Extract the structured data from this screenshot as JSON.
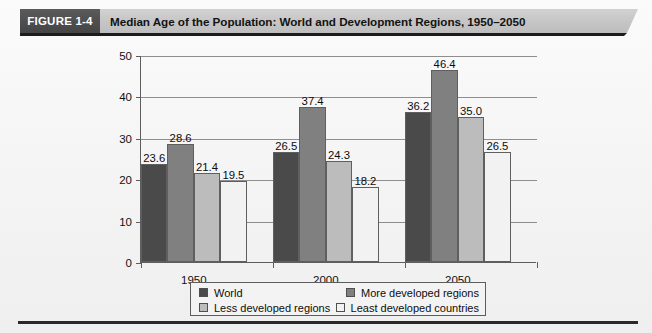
{
  "figure": {
    "badge": "FIGURE 1-4",
    "title": "Median Age of the Population: World and Development Regions, 1950–2050"
  },
  "colors": {
    "world": "#4a4a4a",
    "more_developed": "#808080",
    "less_developed": "#bcbcbc",
    "least_developed": "#f2f2f2",
    "axis": "#5d5d5d",
    "grid": "#8e8e8e",
    "badge_bg": "#4f4f4f",
    "band_bg": "#c6c6c6"
  },
  "legend": {
    "items": [
      {
        "label": "World",
        "color": "#4a4a4a"
      },
      {
        "label": "More developed regions",
        "color": "#808080"
      },
      {
        "label": "Less developed regions",
        "color": "#bcbcbc"
      },
      {
        "label": "Least developed countries",
        "color": "#f2f2f2"
      }
    ]
  },
  "chart_data": {
    "type": "bar",
    "title": "Median Age of the Population: World and Development Regions, 1950–2050",
    "xlabel": "",
    "ylabel": "",
    "categories": [
      "1950",
      "2000",
      "2050"
    ],
    "ylim": [
      0,
      50
    ],
    "yticks": [
      0,
      10,
      20,
      30,
      40,
      50
    ],
    "ytick_labels": [
      "0",
      "10",
      "20",
      "30",
      "40",
      "50"
    ],
    "grid": true,
    "legend_position": "bottom",
    "series": [
      {
        "name": "World",
        "color": "#4a4a4a",
        "values": [
          23.6,
          26.5,
          36.2
        ],
        "labels": [
          "23.6",
          "26.5",
          "36.2"
        ]
      },
      {
        "name": "More developed regions",
        "color": "#808080",
        "values": [
          28.6,
          37.4,
          46.4
        ],
        "labels": [
          "28.6",
          "37.4",
          "46.4"
        ]
      },
      {
        "name": "Less developed regions",
        "color": "#bcbcbc",
        "values": [
          21.4,
          24.3,
          35.0
        ],
        "labels": [
          "21.4",
          "24.3",
          "35.0"
        ]
      },
      {
        "name": "Least developed countries",
        "color": "#f2f2f2",
        "values": [
          19.5,
          18.2,
          26.5
        ],
        "labels": [
          "19.5",
          "18.2",
          "26.5"
        ]
      }
    ]
  }
}
